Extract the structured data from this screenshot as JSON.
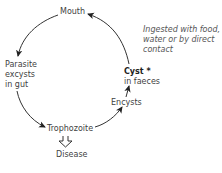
{
  "diagram": {
    "type": "life-cycle",
    "nodes": {
      "mouth": "Mouth",
      "parasite_line1": "Parasite",
      "parasite_line2": "excysts",
      "parasite_line3": "in gut",
      "trophozoite": "Trophozoite",
      "disease": "Disease",
      "encysts": "Encysts",
      "cyst_title": "Cyst *",
      "cyst_sub": "in faeces"
    },
    "note": {
      "line1": "Ingested with food,",
      "line2": "water or by direct",
      "line3": "contact"
    },
    "edges": [
      {
        "from": "Cyst in faeces",
        "to": "Mouth"
      },
      {
        "from": "Mouth",
        "to": "Parasite excysts in gut"
      },
      {
        "from": "Parasite excysts in gut",
        "to": "Trophozoite"
      },
      {
        "from": "Trophozoite",
        "to": "Encysts"
      },
      {
        "from": "Encysts",
        "to": "Cyst in faeces"
      },
      {
        "from": "Trophozoite",
        "to": "Disease",
        "style": "hollow"
      }
    ]
  }
}
